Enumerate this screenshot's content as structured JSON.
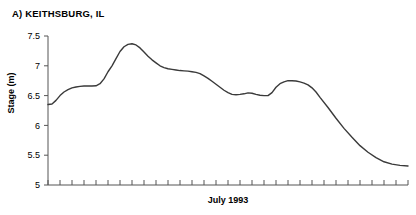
{
  "panel": {
    "title": "A) KEITHSBURG, IL"
  },
  "chart_data": {
    "type": "line",
    "title": "A) KEITHSBURG, IL",
    "subtitle": "",
    "xlabel": "July 1993",
    "ylabel": "Stage (m)",
    "xlim": [
      1,
      31
    ],
    "ylim": [
      5,
      7.5
    ],
    "yticks": [
      5,
      5.5,
      6,
      6.5,
      7,
      7.5
    ],
    "ytick_labels": [
      "5",
      "5.5",
      "6",
      "6.5",
      "7",
      "7.5"
    ],
    "xticks": [
      1,
      2,
      3,
      4,
      5,
      6,
      7,
      8,
      9,
      10,
      11,
      12,
      13,
      14,
      15,
      16,
      17,
      18,
      19,
      20,
      21,
      22,
      23,
      24,
      25,
      26,
      27,
      28,
      29,
      30,
      31
    ],
    "xtick_labels": [],
    "grid": false,
    "legend": false,
    "legend_position": "none",
    "line_color": "#3a3a3a",
    "line_width": 1.4,
    "series": [
      {
        "name": "Stage",
        "x": [
          1,
          1.5,
          2,
          2.5,
          3,
          3.5,
          4,
          4.5,
          5,
          5.5,
          6,
          6.5,
          7,
          7.5,
          8,
          8.5,
          9,
          9.5,
          10,
          10.5,
          11,
          11.5,
          12,
          12.5,
          13,
          13.5,
          14,
          14.5,
          15,
          15.5,
          16,
          16.5,
          17,
          17.5,
          18,
          18.5,
          19,
          19.5,
          20,
          20.5,
          21,
          21.5,
          22,
          22.5,
          23,
          23.5,
          24,
          24.5,
          25,
          25.5,
          26,
          26.5,
          27,
          27.5,
          28,
          28.5,
          29,
          29.5,
          30,
          30.5,
          31
        ],
        "values": [
          6.35,
          6.36,
          6.42,
          6.5,
          6.56,
          6.6,
          6.63,
          6.645,
          6.655,
          6.66,
          6.66,
          6.66,
          6.665,
          6.7,
          6.78,
          6.9,
          7.0,
          7.12,
          7.24,
          7.32,
          7.36,
          7.37,
          7.35,
          7.3,
          7.23,
          7.16,
          7.1,
          7.05,
          7.0,
          6.97,
          6.95,
          6.94,
          6.93,
          6.92,
          6.915,
          6.91,
          6.9,
          6.89,
          6.87,
          6.83,
          6.79,
          6.74,
          6.69,
          6.64,
          6.59,
          6.55,
          6.52,
          6.515,
          6.52,
          6.53,
          6.545,
          6.54,
          6.52,
          6.505,
          6.5,
          6.5,
          6.55,
          6.64,
          6.7,
          6.73,
          6.75
        ]
      }
    ],
    "annotations": [
      {
        "label": "primary-peak",
        "x": 11.5,
        "y": 7.37
      },
      {
        "label": "secondary-peak",
        "x": 31,
        "y": 6.75
      },
      {
        "label": "series-end",
        "x": 46,
        "y": 5.32
      }
    ],
    "series_tail": {
      "x": [
        31.5,
        32,
        32.5,
        33,
        33.5,
        34,
        34.5,
        35,
        36,
        37,
        38,
        39,
        40,
        41,
        42,
        43,
        44,
        45,
        46
      ],
      "values": [
        6.75,
        6.745,
        6.73,
        6.71,
        6.68,
        6.63,
        6.56,
        6.47,
        6.3,
        6.12,
        5.95,
        5.8,
        5.66,
        5.55,
        5.46,
        5.39,
        5.35,
        5.33,
        5.32
      ]
    }
  }
}
